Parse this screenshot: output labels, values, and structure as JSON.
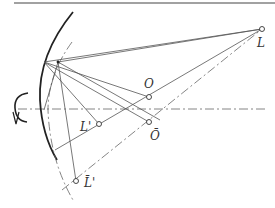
{
  "diagram": {
    "type": "optics-reflection-construction",
    "labels": {
      "L": "L",
      "O": "O",
      "O_bar": "Ō",
      "L_prime": "L'",
      "L_bar_prime": "L̄'"
    },
    "points": {
      "L": [
        262,
        29
      ],
      "O": [
        149,
        97
      ],
      "O_bar": [
        149,
        122
      ],
      "L_prime": [
        99,
        124
      ],
      "L_bar_prime": [
        76,
        181
      ],
      "mirror_point": [
        44,
        62
      ],
      "aux_point": [
        58,
        62
      ]
    },
    "colors": {
      "ink": "#333333",
      "background": "#ffffff"
    }
  }
}
